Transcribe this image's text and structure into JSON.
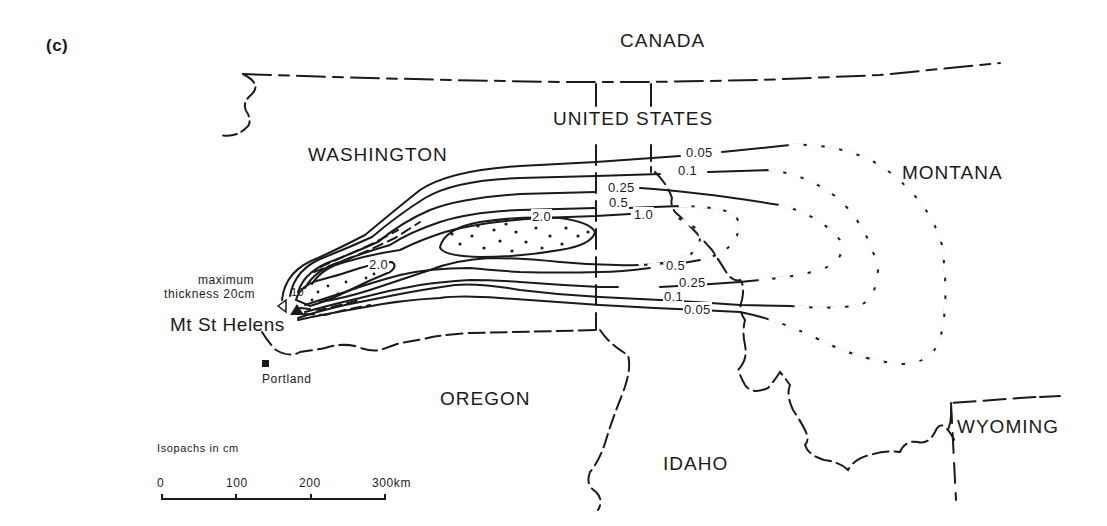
{
  "figure": {
    "panel_label": "(c)",
    "legend_text": "Isopachs in cm",
    "scale_bar": {
      "ticks": [
        "0",
        "100",
        "200",
        "300km"
      ],
      "unit": "km"
    }
  },
  "regions": {
    "canada": "CANADA",
    "united_states": "UNITED STATES",
    "washington": "WASHINGTON",
    "montana": "MONTANA",
    "oregon": "OREGON",
    "idaho": "IDAHO",
    "wyoming": "WYOMING"
  },
  "places": {
    "volcano": "Mt St Helens",
    "city": "Portland",
    "max_note_line1": "maximum",
    "max_note_line2": "thickness 20cm"
  },
  "isopachs": {
    "upper": [
      "0.05",
      "0.1",
      "0.25",
      "0.5",
      "1.0"
    ],
    "core": "2.0",
    "inner_core": "2.0",
    "vent": "10",
    "lower": [
      "0.5",
      "0.25",
      "0.1",
      "0.05"
    ]
  },
  "colors": {
    "ink": "#1a1a1a",
    "background": "#ffffff"
  }
}
